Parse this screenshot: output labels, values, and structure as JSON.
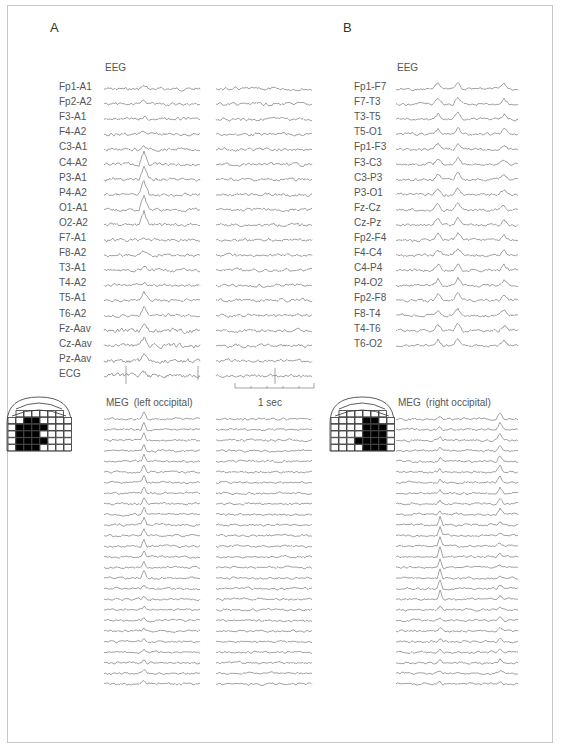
{
  "figure": {
    "panels": [
      {
        "letter": "A",
        "eeg": {
          "title": "EEG",
          "channels": [
            "Fp1-A1",
            "Fp2-A2",
            "F3-A1",
            "F4-A2",
            "C3-A1",
            "C4-A2",
            "P3-A1",
            "P4-A2",
            "O1-A1",
            "O2-A2",
            "F7-A1",
            "F8-A2",
            "T3-A1",
            "T4-A2",
            "T5-A1",
            "T6-A2",
            "Fz-Aav",
            "Cz-Aav",
            "Pz-Aav",
            "ECG"
          ],
          "segments": 2
        },
        "meg": {
          "title": "MEG (left occipital)",
          "trace_count": 26,
          "segments": 2,
          "sensor_side": "left"
        },
        "scalebar": {
          "label": "1 sec"
        }
      },
      {
        "letter": "B",
        "eeg": {
          "title": "EEG",
          "channels": [
            "Fp1-F7",
            "F7-T3",
            "T3-T5",
            "T5-O1",
            "Fp1-F3",
            "F3-C3",
            "C3-P3",
            "P3-O1",
            "Fz-Cz",
            "Cz-Pz",
            "Fp2-F4",
            "F4-C4",
            "C4-P4",
            "P4-O2",
            "Fp2-F8",
            "F8-T4",
            "T4-T6",
            "T6-O2"
          ],
          "segments": 1
        },
        "meg": {
          "title": "MEG (right occipital)",
          "trace_count": 26,
          "segments": 1,
          "sensor_side": "right"
        }
      }
    ],
    "colors": {
      "trace": "#8a8a8a",
      "text": "#555555",
      "sensor_active": "#000000",
      "border": "#c8c8c8"
    }
  }
}
